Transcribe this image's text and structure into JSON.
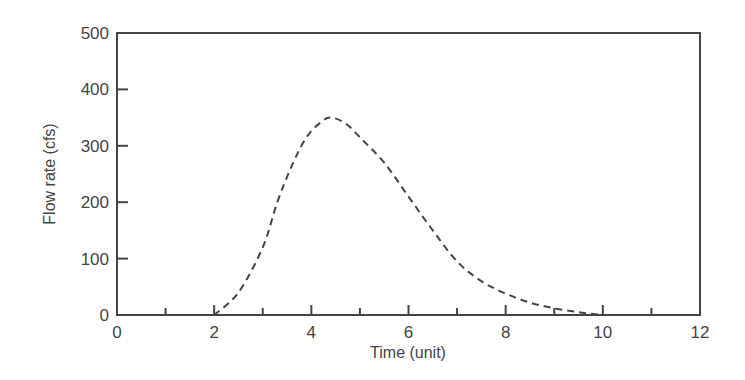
{
  "chart_data": {
    "type": "line",
    "title": "",
    "xlabel": "Time (unit)",
    "ylabel": "Flow rate (cfs)",
    "xlim": [
      0,
      12
    ],
    "ylim": [
      0,
      500
    ],
    "x_ticks": [
      0,
      2,
      4,
      6,
      8,
      10,
      12
    ],
    "x_minor_ticks": [
      1,
      3,
      5,
      7,
      9,
      11
    ],
    "y_ticks": [
      0,
      100,
      200,
      300,
      400,
      500
    ],
    "grid": false,
    "legend": null,
    "series": [
      {
        "name": "hydrograph",
        "style": "dashed",
        "color": "#444444",
        "x": [
          2.0,
          2.5,
          3.0,
          3.3,
          3.6,
          3.9,
          4.2,
          4.4,
          4.7,
          5.0,
          5.5,
          6.0,
          6.5,
          7.0,
          7.5,
          8.0,
          8.5,
          9.0,
          9.5,
          10.0
        ],
        "y": [
          0,
          40,
          120,
          200,
          265,
          315,
          342,
          350,
          340,
          315,
          270,
          210,
          150,
          95,
          60,
          38,
          22,
          12,
          5,
          0
        ]
      }
    ]
  }
}
